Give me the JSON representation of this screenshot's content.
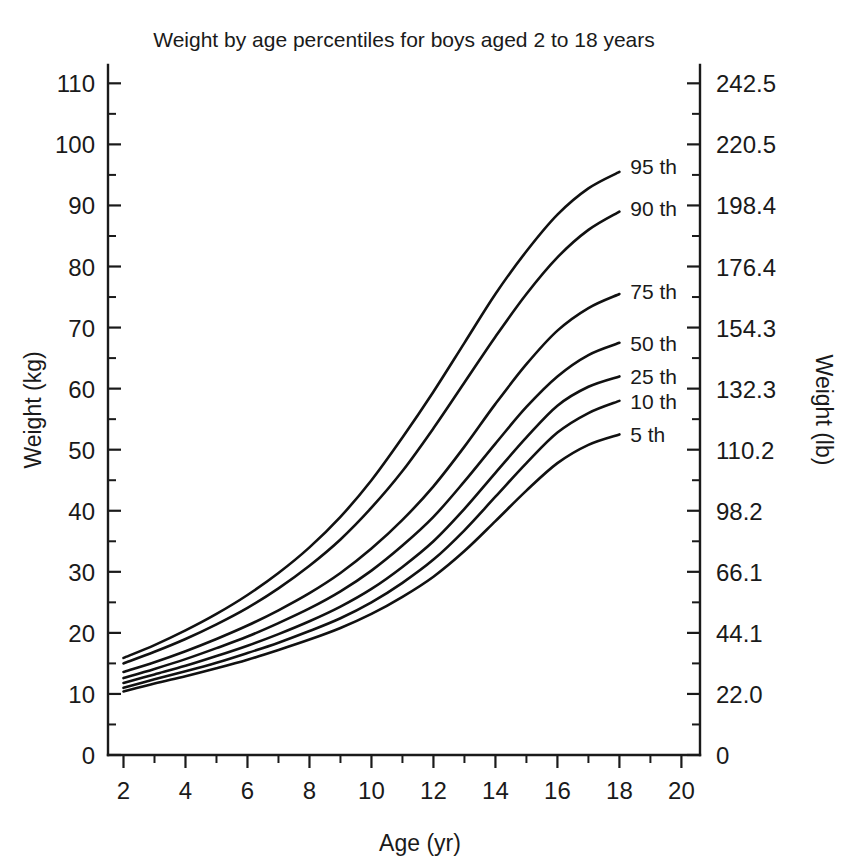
{
  "chart_data": {
    "type": "line",
    "title": "Weight by age percentiles for boys aged 2 to 18 years",
    "xlabel": "Age (yr)",
    "ylabel": "Weight (kg)",
    "ylabel_right": "Weight (lb)",
    "xlim": [
      1.5,
      20.6
    ],
    "ylim": [
      0,
      113
    ],
    "grid": false,
    "legend_position": "right-inline-labels",
    "x_ticks_major": [
      2,
      4,
      6,
      8,
      10,
      12,
      14,
      16,
      18,
      20
    ],
    "x_ticks_minor": [
      3,
      5,
      7,
      9,
      11,
      13,
      15,
      17,
      19
    ],
    "x_tick_labels": [
      "2",
      "4",
      "6",
      "8",
      "10",
      "12",
      "14",
      "16",
      "18",
      "20"
    ],
    "y_ticks_major": [
      0,
      10,
      20,
      30,
      40,
      50,
      60,
      70,
      80,
      90,
      100,
      110
    ],
    "y_ticks_minor": [
      5,
      15,
      25,
      35,
      45,
      55,
      65,
      75,
      85,
      95,
      105
    ],
    "y_tick_labels": [
      "0",
      "10",
      "20",
      "30",
      "40",
      "50",
      "60",
      "70",
      "80",
      "90",
      "100",
      "110"
    ],
    "y_right_tick_values": [
      0,
      10,
      20,
      30,
      40,
      50,
      60,
      70,
      80,
      90,
      100,
      110
    ],
    "y_right_tick_labels": [
      "0",
      "22.0",
      "44.1",
      "66.1",
      "98.2",
      "110.2",
      "132.3",
      "154.3",
      "176.4",
      "198.4",
      "220.5",
      "242.5"
    ],
    "x": [
      2,
      3,
      4,
      5,
      6,
      7,
      8,
      9,
      10,
      11,
      12,
      13,
      14,
      15,
      16,
      17,
      18
    ],
    "series": [
      {
        "name": "95 th",
        "label": "95 th",
        "label_x": 18.35,
        "label_y": 96.5,
        "values": [
          15.9,
          18.0,
          20.4,
          23.1,
          26.2,
          29.8,
          34.0,
          39.0,
          45.0,
          52.0,
          59.5,
          67.5,
          75.5,
          82.5,
          88.5,
          92.8,
          95.5
        ]
      },
      {
        "name": "90 th",
        "label": "90 th",
        "label_x": 18.35,
        "label_y": 89.5,
        "values": [
          15.0,
          16.9,
          19.0,
          21.4,
          24.1,
          27.3,
          31.0,
          35.3,
          40.5,
          46.5,
          53.5,
          61.0,
          68.5,
          75.5,
          81.5,
          86.0,
          89.0
        ]
      },
      {
        "name": "75 th",
        "label": "75 th",
        "label_x": 18.35,
        "label_y": 76.0,
        "values": [
          13.6,
          15.2,
          17.0,
          19.0,
          21.2,
          23.7,
          26.5,
          29.8,
          33.8,
          38.5,
          44.0,
          50.5,
          57.5,
          64.0,
          69.5,
          73.2,
          75.5
        ]
      },
      {
        "name": "50 th",
        "label": "50 th",
        "label_x": 18.35,
        "label_y": 67.5,
        "values": [
          12.6,
          14.1,
          15.7,
          17.5,
          19.4,
          21.6,
          24.0,
          26.8,
          30.2,
          34.3,
          39.0,
          44.8,
          51.0,
          57.0,
          62.0,
          65.5,
          67.5
        ]
      },
      {
        "name": "25 th",
        "label": "25 th",
        "label_x": 18.35,
        "label_y": 62.0,
        "values": [
          11.8,
          13.2,
          14.6,
          16.2,
          17.9,
          19.8,
          21.9,
          24.3,
          27.2,
          30.8,
          35.0,
          40.3,
          46.2,
          52.0,
          57.2,
          60.3,
          62.0
        ]
      },
      {
        "name": "10 th",
        "label": "10 th",
        "label_x": 18.35,
        "label_y": 58.0,
        "values": [
          11.0,
          12.4,
          13.7,
          15.1,
          16.7,
          18.4,
          20.3,
          22.4,
          25.0,
          28.2,
          32.0,
          36.8,
          42.3,
          47.8,
          52.8,
          56.0,
          58.0
        ]
      },
      {
        "name": "5 th",
        "label": "5 th",
        "label_x": 18.35,
        "label_y": 52.5,
        "values": [
          10.4,
          11.7,
          12.9,
          14.2,
          15.6,
          17.2,
          18.9,
          20.8,
          23.1,
          25.9,
          29.2,
          33.4,
          38.3,
          43.3,
          47.8,
          50.8,
          52.5
        ]
      }
    ]
  },
  "colors": {
    "background": "#ffffff",
    "line": "#111111",
    "text": "#1a1a1a"
  }
}
